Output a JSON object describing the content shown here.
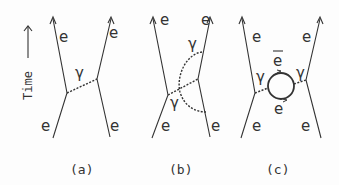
{
  "axis": {
    "label": "Time",
    "direction": "up"
  },
  "panels": [
    {
      "id": "a",
      "caption": "(a)",
      "labels": {
        "top_left": "e",
        "top_right": "e",
        "bottom_left": "e",
        "bottom_right": "e",
        "photon": "γ"
      }
    },
    {
      "id": "b",
      "caption": "(b)",
      "labels": {
        "top_left": "e",
        "top_right": "e",
        "bottom_left": "e",
        "bottom_right": "e",
        "photon_upper": "γ",
        "photon_lower": "γ"
      }
    },
    {
      "id": "c",
      "caption": "(c)",
      "labels": {
        "top_left": "e",
        "top_right": "e",
        "bottom_left": "e",
        "bottom_right": "e",
        "photon_left": "γ",
        "photon_right": "γ",
        "loop_top": "e",
        "loop_bottom": "e"
      }
    }
  ],
  "colors": {
    "ink": "#333333",
    "background": "#fdfdfd"
  }
}
